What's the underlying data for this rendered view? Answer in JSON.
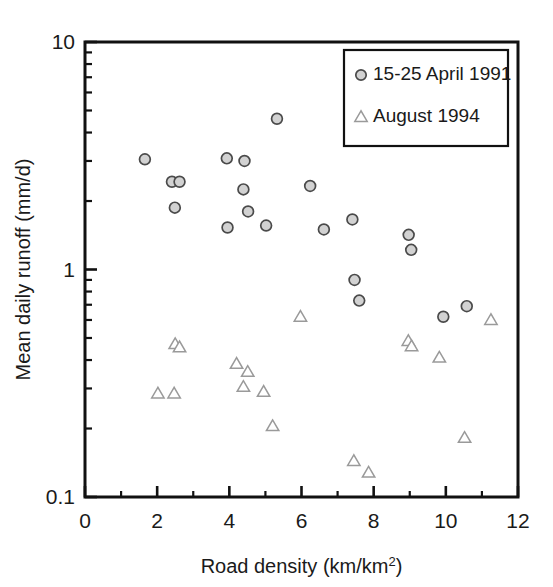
{
  "chart_data": {
    "type": "scatter",
    "title": "",
    "xlabel": "Road density (km/km2)",
    "xlabel_base": "Road density (km/km",
    "xlabel_sup": "2",
    "xlabel_tail": ")",
    "ylabel": "Mean daily runoff (mm/d)",
    "xlim": [
      0,
      12
    ],
    "ylim": [
      0.1,
      10
    ],
    "yscale": "log",
    "xscale": "linear",
    "grid": false,
    "legend_position": "top-right",
    "xticks": [
      0,
      2,
      4,
      6,
      8,
      10,
      12
    ],
    "xtick_labels": [
      "0",
      "2",
      "4",
      "6",
      "8",
      "10",
      "12"
    ],
    "xminor_ticks": [
      1,
      3,
      5,
      7,
      9,
      11
    ],
    "yticks": [
      0.1,
      1,
      10
    ],
    "ytick_labels": [
      "0.1",
      "1",
      "10"
    ],
    "yminor_ticks": [
      0.2,
      0.3,
      0.4,
      0.5,
      0.6,
      0.7,
      0.8,
      0.9,
      2,
      3,
      4,
      5,
      6,
      7,
      8,
      9
    ],
    "series": [
      {
        "name": "15-25 April 1991",
        "marker": "circle",
        "fill": "#d2d2d2",
        "stroke": "#4a4a4a",
        "points": [
          {
            "x": 1.66,
            "y": 3.05
          },
          {
            "x": 2.41,
            "y": 2.43
          },
          {
            "x": 2.62,
            "y": 2.43
          },
          {
            "x": 2.49,
            "y": 1.87
          },
          {
            "x": 3.93,
            "y": 3.08
          },
          {
            "x": 3.95,
            "y": 1.53
          },
          {
            "x": 4.42,
            "y": 3.0
          },
          {
            "x": 4.39,
            "y": 2.25
          },
          {
            "x": 4.52,
            "y": 1.8
          },
          {
            "x": 5.02,
            "y": 1.56
          },
          {
            "x": 5.32,
            "y": 4.6
          },
          {
            "x": 6.24,
            "y": 2.33
          },
          {
            "x": 6.62,
            "y": 1.5
          },
          {
            "x": 7.41,
            "y": 1.66
          },
          {
            "x": 7.47,
            "y": 0.9
          },
          {
            "x": 7.6,
            "y": 0.73
          },
          {
            "x": 8.97,
            "y": 1.42
          },
          {
            "x": 9.04,
            "y": 1.22
          },
          {
            "x": 9.93,
            "y": 0.62
          },
          {
            "x": 10.58,
            "y": 0.69
          }
        ]
      },
      {
        "name": "August 1994",
        "marker": "triangle",
        "fill": "#ffffff",
        "stroke": "#9a9a9a",
        "points": [
          {
            "x": 2.02,
            "y": 0.285
          },
          {
            "x": 2.47,
            "y": 0.285
          },
          {
            "x": 2.5,
            "y": 0.47
          },
          {
            "x": 2.62,
            "y": 0.455
          },
          {
            "x": 4.2,
            "y": 0.385
          },
          {
            "x": 4.39,
            "y": 0.305
          },
          {
            "x": 4.51,
            "y": 0.355
          },
          {
            "x": 4.95,
            "y": 0.29
          },
          {
            "x": 5.2,
            "y": 0.205
          },
          {
            "x": 5.97,
            "y": 0.62
          },
          {
            "x": 7.45,
            "y": 0.144
          },
          {
            "x": 7.86,
            "y": 0.128
          },
          {
            "x": 8.96,
            "y": 0.485
          },
          {
            "x": 9.05,
            "y": 0.46
          },
          {
            "x": 9.82,
            "y": 0.41
          },
          {
            "x": 10.52,
            "y": 0.182
          },
          {
            "x": 11.25,
            "y": 0.6
          }
        ]
      }
    ],
    "legend": [
      {
        "label": "15-25 April 1991",
        "marker": "circle"
      },
      {
        "label": "August 1994",
        "marker": "triangle"
      }
    ]
  }
}
